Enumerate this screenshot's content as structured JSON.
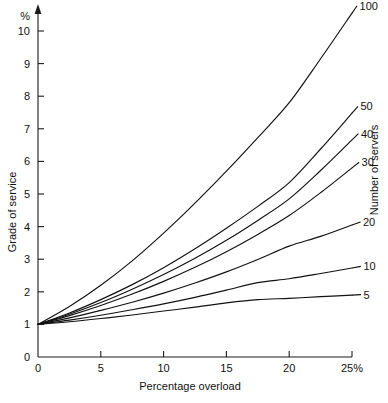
{
  "chart_data": {
    "type": "line",
    "title": "",
    "xlabel": "Percentage overload",
    "ylabel": "Grade of service",
    "legend_title": "Number of servers",
    "legend_position": "right-inline",
    "grid": false,
    "x_unit_mark": "25%",
    "y_unit_mark": "%",
    "xlim": [
      0,
      25
    ],
    "ylim": [
      0,
      10
    ],
    "xticks": [
      0,
      5,
      10,
      15,
      20,
      25
    ],
    "xticklabels": [
      "0",
      "5",
      "10",
      "15",
      "20",
      "25%"
    ],
    "yticks": [
      0,
      1,
      2,
      3,
      4,
      5,
      6,
      7,
      8,
      9,
      10
    ],
    "yticklabels": [
      "0",
      "1",
      "2",
      "3",
      "4",
      "5",
      "6",
      "7",
      "8",
      "9",
      "10"
    ],
    "x": [
      0,
      2.5,
      5,
      7.5,
      10,
      12.5,
      15,
      17.5,
      20,
      22.5,
      25
    ],
    "series": [
      {
        "name": "100",
        "label": "100",
        "values": [
          1.0,
          1.55,
          2.2,
          2.95,
          3.8,
          4.72,
          5.7,
          6.73,
          7.8,
          9.15,
          10.55
        ]
      },
      {
        "name": "50",
        "label": "50",
        "values": [
          1.0,
          1.35,
          1.76,
          2.22,
          2.74,
          3.32,
          3.95,
          4.62,
          5.35,
          6.38,
          7.48
        ]
      },
      {
        "name": "40",
        "label": "40",
        "values": [
          1.0,
          1.31,
          1.67,
          2.08,
          2.53,
          3.03,
          3.58,
          4.19,
          4.85,
          5.72,
          6.66
        ]
      },
      {
        "name": "30",
        "label": "30",
        "values": [
          1.0,
          1.27,
          1.58,
          1.93,
          2.32,
          2.75,
          3.23,
          3.76,
          4.34,
          5.04,
          5.8
        ]
      },
      {
        "name": "20",
        "label": "20",
        "values": [
          1.0,
          1.2,
          1.43,
          1.68,
          1.96,
          2.27,
          2.61,
          2.99,
          3.4,
          3.7,
          4.05
        ]
      },
      {
        "name": "10",
        "label": "10",
        "values": [
          1.0,
          1.13,
          1.28,
          1.45,
          1.63,
          1.83,
          2.05,
          2.28,
          2.4,
          2.56,
          2.73
        ]
      },
      {
        "name": "5",
        "label": "5",
        "values": [
          1.0,
          1.08,
          1.18,
          1.29,
          1.41,
          1.53,
          1.66,
          1.76,
          1.8,
          1.85,
          1.9
        ]
      }
    ]
  }
}
